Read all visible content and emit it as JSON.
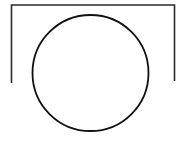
{
  "diagram": {
    "background": "#ffffff",
    "stroke_color": "#1a1a1a",
    "shapes": [
      {
        "type": "open-rectangle",
        "description": "bracket open at bottom",
        "left": 11,
        "top": 5,
        "right": 174,
        "left_bottom": 83,
        "right_bottom": 81
      },
      {
        "type": "circle",
        "cx": 90,
        "cy": 73,
        "r": 58
      }
    ]
  }
}
